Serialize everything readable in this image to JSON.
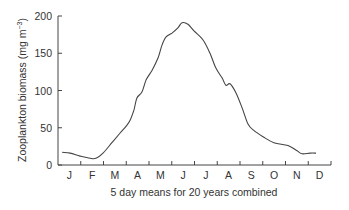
{
  "chart_data": {
    "type": "line",
    "title": "",
    "xlabel": "5 day means for 20 years combined",
    "ylabel": "Zooplankton biomass (mg m⁻³)",
    "ylabel_main": "Zooplankton biomass (mg m",
    "ylabel_sup": "−3",
    "ylabel_close": ")",
    "ylim": [
      0,
      200
    ],
    "yticks": [
      0,
      50,
      100,
      150,
      200
    ],
    "xticks_months": [
      "J",
      "F",
      "M",
      "A",
      "M",
      "J",
      "J",
      "A",
      "S",
      "O",
      "N",
      "D"
    ],
    "grid": false,
    "legend": null,
    "series": [
      {
        "name": "Zooplankton biomass",
        "color": "#444444",
        "x_month_fraction": [
          0.18,
          0.53,
          0.97,
          1.41,
          1.67,
          1.98,
          2.37,
          2.73,
          2.99,
          3.17,
          3.34,
          3.47,
          3.69,
          3.87,
          4.13,
          4.4,
          4.57,
          4.75,
          5.01,
          5.27,
          5.45,
          5.71,
          5.98,
          6.37,
          6.68,
          6.94,
          7.21,
          7.38,
          7.56,
          7.82,
          8.09,
          8.35,
          8.62,
          9.01,
          9.49,
          10.11,
          10.51,
          10.73,
          11.08,
          11.34
        ],
        "values": [
          17,
          16,
          12,
          9,
          9,
          16,
          30,
          43,
          52,
          60,
          74,
          90,
          98,
          114,
          127,
          144,
          161,
          172,
          177,
          184,
          191,
          189,
          180,
          168,
          150,
          130,
          117,
          107,
          109,
          97,
          77,
          55,
          46,
          38,
          30,
          26,
          19,
          15,
          16,
          16
        ]
      }
    ]
  }
}
